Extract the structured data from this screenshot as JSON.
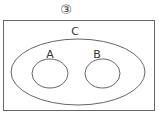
{
  "figure": {
    "number_label": "③",
    "universe": {
      "shape": "rectangle"
    },
    "sets": [
      {
        "id": "C",
        "label": "C",
        "contains": [
          "A",
          "B"
        ]
      },
      {
        "id": "A",
        "label": "A"
      },
      {
        "id": "B",
        "label": "B"
      }
    ],
    "colors": {
      "stroke": "#666666",
      "text": "#333333",
      "background": "#ffffff"
    }
  }
}
